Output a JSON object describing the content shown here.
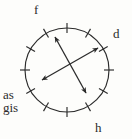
{
  "figure": {
    "kind": "circular-diagram",
    "background_color": "#fdfdfb",
    "stroke_color": "#2b2b2b",
    "circle": {
      "center_x": 67,
      "center_y": 70,
      "radius": 42,
      "tick_count": 12,
      "tick_inner_radius": 37,
      "tick_outer_radius": 47,
      "tick_step_degrees": 30
    },
    "arrows": [
      {
        "name": "arrow-nw-se",
        "start_x": 55,
        "start_y": 37,
        "end_x": 86,
        "end_y": 93,
        "double_headed": true
      },
      {
        "name": "arrow-sw-ne",
        "start_x": 42,
        "start_y": 80,
        "end_x": 98,
        "end_y": 48,
        "double_headed": true
      }
    ],
    "labels": [
      {
        "id": "f",
        "text": "f",
        "position": "top-left"
      },
      {
        "id": "d",
        "text": "d",
        "position": "right"
      },
      {
        "id": "h",
        "text": "h",
        "position": "bottom-right"
      },
      {
        "id": "as",
        "text": "as",
        "position": "left-upper"
      },
      {
        "id": "gis",
        "text": "gis",
        "position": "left-lower"
      }
    ]
  }
}
